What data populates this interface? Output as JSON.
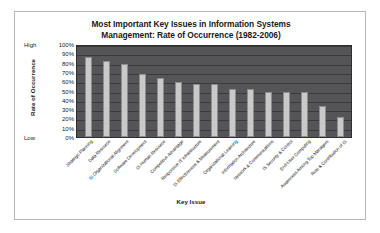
{
  "chart_data": {
    "type": "bar",
    "title": "Most Important Key Issues in Information Systems Management: Rate of Occurrence (1982-2006)",
    "title_line1": "Most Important Key Issues in Information Systems",
    "title_line2": "Management: Rate of Occurrence (1982-2006)",
    "xlabel": "Key Issue",
    "ylabel": "Rate of Occurrence",
    "ylim": [
      0,
      100
    ],
    "grid": true,
    "legend": "none",
    "y_tick_labels": [
      "100%",
      "90%",
      "80%",
      "70%",
      "60%",
      "50%",
      "40%",
      "30%",
      "20%",
      "10%",
      "0%"
    ],
    "y_tick_values": [
      100,
      90,
      80,
      70,
      60,
      50,
      40,
      30,
      20,
      10,
      0
    ],
    "y_axis_qualifiers": {
      "high": "High",
      "low": "Low"
    },
    "categories": [
      "Strategic Planning",
      "Data Resource",
      "IS Organizational Alignment",
      "Software Development",
      "IS Human Resource",
      "Competitive Advantage",
      "Responsive IT Infrastructure",
      "IS Effectiveness & Measurement",
      "Organizational Learning",
      "Information Architecture",
      "Network & Communications",
      "IS Security & Control",
      "End-User Computing",
      "Awareness Among Top Managers",
      "Role & Contribution of IS"
    ],
    "values": [
      88,
      84,
      80,
      69,
      65,
      61,
      58,
      58,
      53,
      53,
      50,
      50,
      50,
      34,
      22
    ],
    "colors": {
      "plot_background": "#555558",
      "bar_fill": "#c9c9c9",
      "bar_border": "#8d8d8d",
      "gridline": "#3a3a3c",
      "frame_border": "#b8b8b8",
      "text": "#1a1a1a",
      "page_background": "#ffffff"
    }
  }
}
